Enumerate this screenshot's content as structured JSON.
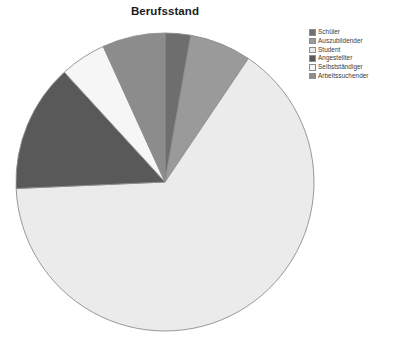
{
  "chart_data": {
    "type": "pie",
    "title": "Berufsstand",
    "xlabel": "",
    "ylabel": "",
    "grid": false,
    "legend_position": "top-right",
    "start_angle_deg": 0,
    "direction": "clockwise",
    "categories": [
      "Schüler",
      "Auszubildender",
      "Student",
      "Angestellter",
      "Selbstständiger",
      "Arbeitssuchender"
    ],
    "values": [
      2.8,
      6.7,
      64.9,
      13.9,
      5.0,
      6.7
    ],
    "slices": [
      {
        "label": "Schüler",
        "value": 2.8,
        "start_deg": 0.0,
        "end_deg": 10.0,
        "color": "#6e6e6e"
      },
      {
        "label": "Auszubildender",
        "value": 6.7,
        "start_deg": 10.0,
        "end_deg": 34.0,
        "color": "#9a9a9a"
      },
      {
        "label": "Student",
        "value": 64.9,
        "start_deg": 34.0,
        "end_deg": 267.5,
        "color": "#ebebeb"
      },
      {
        "label": "Angestellter",
        "value": 13.9,
        "start_deg": 267.5,
        "end_deg": 317.5,
        "color": "#595959"
      },
      {
        "label": "Selbstständiger",
        "value": 5.0,
        "start_deg": 317.5,
        "end_deg": 335.5,
        "color": "#f6f6f6"
      },
      {
        "label": "Arbeitssuchender",
        "value": 6.7,
        "start_deg": 335.5,
        "end_deg": 360.0,
        "color": "#8c8c8c"
      }
    ],
    "geometry": {
      "center_x": 150,
      "center_y": 150,
      "radius": 149
    },
    "stroke_color": "#8d8d8d",
    "background_color": "#ffffff"
  },
  "legend": {
    "items": [
      {
        "label": "Schüler",
        "color": "#6e6e6e"
      },
      {
        "label": "Auszubildender",
        "color": "#9a9a9a"
      },
      {
        "label": "Student",
        "color": "#ebebeb"
      },
      {
        "label": "Angestellter",
        "color": "#595959"
      },
      {
        "label": "Selbstständiger",
        "color": "#f6f6f6"
      },
      {
        "label": "Arbeitssuchender",
        "color": "#8c8c8c"
      }
    ]
  }
}
